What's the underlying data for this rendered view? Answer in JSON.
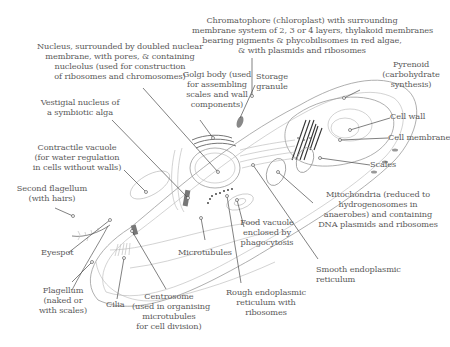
{
  "diagram": {
    "labels": [
      {
        "id": "nucleus",
        "text": "Nucleus, surrounded by doubled nuclear\nmembrane, with pores, & containing\nnucleolus (used for construction\nof ribosomes and chromosomes)"
      },
      {
        "id": "chromatophore",
        "text": "Chromatophore (chloroplast) with surrounding\nmembrane system of 2, 3 or 4 layers, thylakoid membranes\nbearing pigments & phycobilisomes in red algae,\n& with plasmids and ribosomes"
      },
      {
        "id": "golgi",
        "text": "Golgi body (used\nfor assembling\nscales and wall\ncomponents)"
      },
      {
        "id": "storage",
        "text": "Storage\ngranule"
      },
      {
        "id": "pyrenoid",
        "text": "Pyrenoid\n(carbohydrate\nsynthesis)"
      },
      {
        "id": "vestigial",
        "text": "Vestigial nucleus of\na symbiotic alga"
      },
      {
        "id": "cellwall",
        "text": "Cell wall"
      },
      {
        "id": "cellmembrane",
        "text": "Cell membrane"
      },
      {
        "id": "scales",
        "text": "Scales"
      },
      {
        "id": "contractile",
        "text": "Contractile vacuole\n(for water regulation\nin cells without walls)"
      },
      {
        "id": "secondflag",
        "text": "Second flagellum\n(with hairs)"
      },
      {
        "id": "mito",
        "text": "Mitochondria (reduced to\nhydrogenosomes in\nanaerobes) and containing\nDNA plasmids and ribosomes"
      },
      {
        "id": "foodvac",
        "text": "Food vacuole\nenclosed by\nphagocytosis"
      },
      {
        "id": "eyespot",
        "text": "Eyespot"
      },
      {
        "id": "microtubules",
        "text": "Microtubules"
      },
      {
        "id": "smootheer",
        "text": "Smooth endoplasmic\nreticulum"
      },
      {
        "id": "flagellum",
        "text": "Flagellum\n(naked or\nwith scales)"
      },
      {
        "id": "cilia",
        "text": "Cilia"
      },
      {
        "id": "centrosome",
        "text": "Centrosome\n(used in organising\nmicrotubules\nfor cell division)"
      },
      {
        "id": "rougheer",
        "text": "Rough endoplasmic\nreticulum with\nribosomes"
      }
    ]
  }
}
